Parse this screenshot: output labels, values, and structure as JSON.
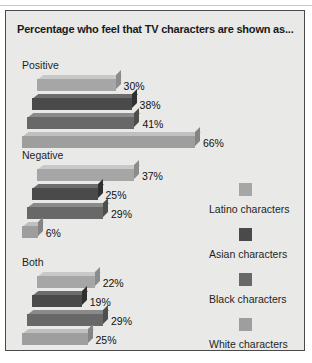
{
  "chart_data": {
    "type": "bar",
    "title": "Percentage who feel that TV characters are shown as...",
    "orientation": "horizontal",
    "style": "3d",
    "xlabel": "",
    "ylabel": "",
    "xlim": [
      0,
      70
    ],
    "grid": false,
    "legend_position": "right",
    "categories": [
      "Positive",
      "Negative",
      "Both"
    ],
    "series": [
      {
        "name": "Latino characters",
        "color": "#a6a6a6",
        "values": [
          30,
          37,
          22
        ]
      },
      {
        "name": "Asian characters",
        "color": "#4a4a4a",
        "values": [
          38,
          25,
          19
        ]
      },
      {
        "name": "Black characters",
        "color": "#686868",
        "values": [
          41,
          29,
          29
        ]
      },
      {
        "name": "White characters",
        "color": "#9e9e9e",
        "values": [
          66,
          6,
          25
        ]
      }
    ],
    "value_labels": [
      "30%",
      "38%",
      "41%",
      "66%",
      "37%",
      "25%",
      "29%",
      "6%",
      "22%",
      "19%",
      "29%",
      "25%"
    ]
  },
  "groups": [
    {
      "label": "Positive",
      "bars": [
        {
          "series": "Latino characters",
          "value": 30,
          "label": "30%"
        },
        {
          "series": "Asian characters",
          "value": 38,
          "label": "38%"
        },
        {
          "series": "Black characters",
          "value": 41,
          "label": "41%"
        },
        {
          "series": "White characters",
          "value": 66,
          "label": "66%"
        }
      ]
    },
    {
      "label": "Negative",
      "bars": [
        {
          "series": "Latino characters",
          "value": 37,
          "label": "37%"
        },
        {
          "series": "Asian characters",
          "value": 25,
          "label": "25%"
        },
        {
          "series": "Black characters",
          "value": 29,
          "label": "29%"
        },
        {
          "series": "White characters",
          "value": 6,
          "label": "6%"
        }
      ]
    },
    {
      "label": "Both",
      "bars": [
        {
          "series": "Latino characters",
          "value": 22,
          "label": "22%"
        },
        {
          "series": "Asian characters",
          "value": 19,
          "label": "19%"
        },
        {
          "series": "Black characters",
          "value": 29,
          "label": "29%"
        },
        {
          "series": "White characters",
          "value": 25,
          "label": "25%"
        }
      ]
    }
  ],
  "legend": {
    "items": [
      {
        "label": "Latino characters",
        "color": "#a6a6a6"
      },
      {
        "label": "Asian characters",
        "color": "#4a4a4a"
      },
      {
        "label": "Black characters",
        "color": "#686868"
      },
      {
        "label": "White characters",
        "color": "#9e9e9e"
      }
    ]
  },
  "colors": {
    "panel_background": "#e9e9e7",
    "panel_border": "#4a4a4a",
    "page_background": "#ffffff",
    "text": "#1f1f1f"
  }
}
